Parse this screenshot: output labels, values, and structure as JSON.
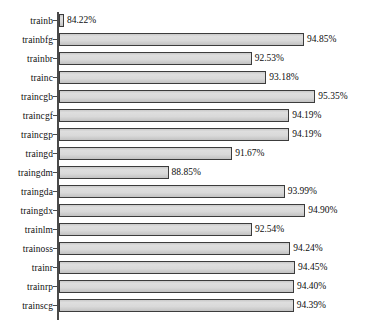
{
  "chart_data": {
    "type": "bar",
    "orientation": "horizontal",
    "title": "",
    "xlabel": "",
    "ylabel": "",
    "xlim": [
      84.0,
      95.6
    ],
    "grid": false,
    "legend": false,
    "value_suffix": "%",
    "categories": [
      "trainb",
      "trainbfg",
      "trainbr",
      "trainc",
      "traincgb",
      "traincgf",
      "traincgp",
      "traingd",
      "traingdm",
      "traingda",
      "traingdx",
      "trainlm",
      "trainoss",
      "trainr",
      "trainrp",
      "trainscg"
    ],
    "values": [
      84.22,
      94.85,
      92.53,
      93.18,
      95.35,
      94.19,
      94.19,
      91.67,
      88.85,
      93.99,
      94.9,
      92.54,
      94.24,
      94.45,
      94.4,
      94.39
    ],
    "value_labels": [
      "84.22%",
      "94.85%",
      "92.53%",
      "93.18%",
      "95.35%",
      "94.19%",
      "94.19%",
      "91.67%",
      "88.85%",
      "93.99%",
      "94.90%",
      "92.54%",
      "94.24%",
      "94.45%",
      "94.40%",
      "94.39%"
    ]
  },
  "style": {
    "bar_fill": "#d9d9d9",
    "bar_border": "#3c3c3c",
    "axis_color": "#4a4a4a",
    "text_color": "#101010",
    "background": "#ffffff"
  }
}
